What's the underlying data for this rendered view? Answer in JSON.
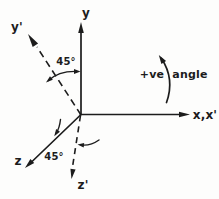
{
  "colors": {
    "background": "#fdfdfc",
    "ink": "#1c1c1c"
  },
  "axis_labels": {
    "y": "y",
    "y_prime": "y'",
    "x": "x,x'",
    "z": "z",
    "z_prime": "z'"
  },
  "angle_labels": {
    "upper": "45°",
    "lower": "45°"
  },
  "annotation": {
    "sign": "+ve",
    "word": "angle"
  }
}
